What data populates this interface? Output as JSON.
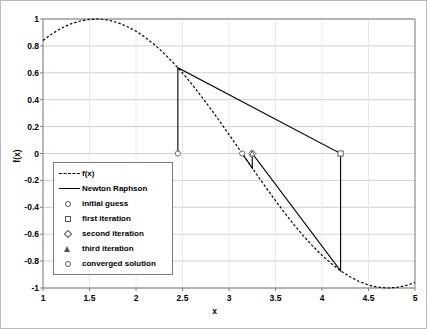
{
  "chart_data": {
    "type": "line",
    "title": "",
    "xlabel": "x",
    "ylabel": "f(x)",
    "xlim": [
      1,
      5
    ],
    "ylim": [
      -1,
      1
    ],
    "grid": true,
    "legend_position": "inside-left",
    "xticks": [
      "1",
      "1.5",
      "2",
      "2.5",
      "3",
      "3.5",
      "4",
      "4.5",
      "5"
    ],
    "xtick_values": [
      1,
      1.5,
      2,
      2.5,
      3,
      3.5,
      4,
      4.5,
      5
    ],
    "yticks": [
      "1",
      "0.8",
      "0.6",
      "0.4",
      "0.2",
      "0",
      "-0.2",
      "-0.4",
      "-0.6",
      "-0.8",
      "-1"
    ],
    "ytick_values": [
      1,
      0.8,
      0.6,
      0.4,
      0.2,
      0,
      -0.2,
      -0.4,
      -0.6,
      -0.8,
      -1
    ],
    "series": [
      {
        "name": "f(x)",
        "style": "dashed",
        "color": "#000000",
        "function": "sin(x)",
        "x": [
          1.0,
          1.1,
          1.2,
          1.3,
          1.4,
          1.5,
          1.6,
          1.7,
          1.8,
          1.9,
          2.0,
          2.1,
          2.2,
          2.3,
          2.4,
          2.5,
          2.6,
          2.7,
          2.8,
          2.9,
          3.0,
          3.1,
          3.2,
          3.3,
          3.4,
          3.5,
          3.6,
          3.7,
          3.8,
          3.9,
          4.0,
          4.1,
          4.2,
          4.3,
          4.4,
          4.5,
          4.6,
          4.7,
          4.8,
          4.9,
          5.0
        ],
        "values": [
          0.841,
          0.891,
          0.932,
          0.964,
          0.985,
          0.997,
          1.0,
          0.992,
          0.974,
          0.946,
          0.909,
          0.863,
          0.808,
          0.746,
          0.675,
          0.599,
          0.516,
          0.427,
          0.335,
          0.239,
          0.141,
          0.042,
          -0.058,
          -0.158,
          -0.256,
          -0.351,
          -0.443,
          -0.53,
          -0.612,
          -0.688,
          -0.757,
          -0.818,
          -0.872,
          -0.916,
          -0.952,
          -0.978,
          -0.994,
          -1.0,
          -0.996,
          -0.982,
          -0.959
        ]
      },
      {
        "name": "Newton Raphson",
        "style": "solid",
        "color": "#000000",
        "x": [
          2.45,
          2.45,
          4.2,
          4.2,
          3.25,
          3.25,
          3.1416
        ],
        "values": [
          0.0,
          0.638,
          0.0,
          -0.872,
          0.0,
          -0.108,
          0.0
        ]
      }
    ],
    "points": [
      {
        "name": "initial guess",
        "marker": "circle",
        "x": 2.45,
        "y": 0.0
      },
      {
        "name": "first iteration",
        "marker": "square",
        "x": 4.2,
        "y": 0.0
      },
      {
        "name": "second iteration",
        "marker": "diamond",
        "x": 3.25,
        "y": 0.0
      },
      {
        "name": "third iteration",
        "marker": "triangle",
        "x": 3.25,
        "y": 0.0
      },
      {
        "name": "converged solution",
        "marker": "circle",
        "x": 3.1416,
        "y": 0.0
      }
    ]
  },
  "legend": {
    "entries": [
      {
        "label": "f(x)",
        "key": "dash-line-key"
      },
      {
        "label": "Newton Raphson",
        "key": "solid-line-key"
      },
      {
        "label": "initial guess",
        "key": "circle-marker-key"
      },
      {
        "label": "first iteration",
        "key": "square-marker-key"
      },
      {
        "label": "second iteration",
        "key": "diamond-marker-key"
      },
      {
        "label": "third iteration",
        "key": "triangle-marker-key"
      },
      {
        "label": "converged solution",
        "key": "circle-marker-key"
      }
    ]
  },
  "axes": {
    "x_title": "x",
    "y_title": "f(x)",
    "x_ticks": [
      "1",
      "1.5",
      "2",
      "2.5",
      "3",
      "3.5",
      "4",
      "4.5",
      "5"
    ],
    "y_ticks": [
      "1",
      "0.8",
      "0.6",
      "0.4",
      "0.2",
      "0",
      "-0.2",
      "-0.4",
      "-0.6",
      "-0.8",
      "-1"
    ]
  },
  "colors": {
    "grid": "#d0d0d0",
    "axis": "#808080",
    "series": "#000000",
    "frame": "#b9b9b9",
    "background": "#ffffff"
  }
}
